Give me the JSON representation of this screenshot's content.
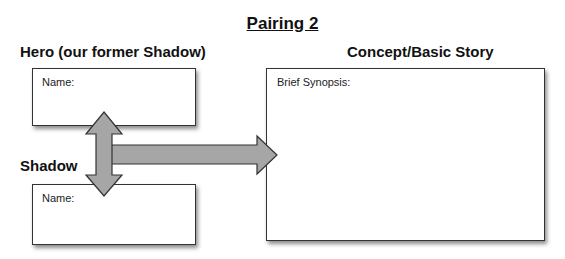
{
  "title": "Pairing 2",
  "hero": {
    "heading": "Hero (our former Shadow)",
    "field_label": "Name:"
  },
  "shadow": {
    "heading": "Shadow",
    "field_label": "Name:"
  },
  "concept": {
    "heading": "Concept/Basic Story",
    "field_label": "Brief Synopsis:"
  },
  "colors": {
    "arrow_fill": "#a6a6a6",
    "arrow_stroke": "#333333",
    "box_border": "#333333"
  }
}
